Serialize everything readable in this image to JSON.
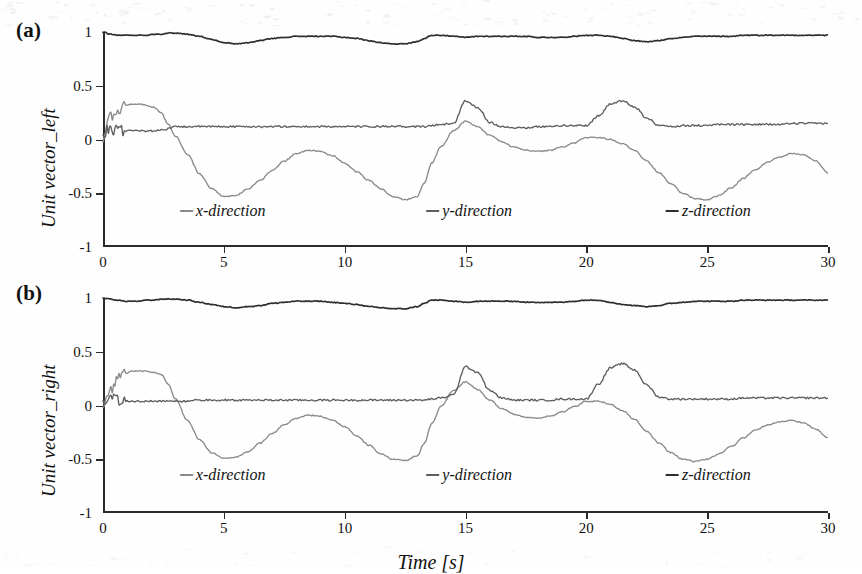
{
  "figure": {
    "xlabel": "Time [s]",
    "panels": [
      {
        "tag": "(a)",
        "ylabel": "Unit vector_left"
      },
      {
        "tag": "(b)",
        "ylabel": "Unit vector_right"
      }
    ]
  },
  "chart_data": [
    {
      "type": "line",
      "title": "(a) Unit vector_left",
      "xlabel": "Time [s]",
      "ylabel": "Unit vector_left",
      "xlim": [
        0,
        30
      ],
      "ylim": [
        -1,
        1
      ],
      "xticks": [
        0,
        5,
        10,
        15,
        20,
        25,
        30
      ],
      "xticklabels": [
        "0",
        "5",
        "10",
        "15",
        "20",
        "25",
        "30"
      ],
      "yticks": [
        -1,
        -0.5,
        0,
        0.5,
        1
      ],
      "yticklabels": [
        "-1",
        "-0.5",
        "0",
        "0.5",
        "1"
      ],
      "grid": false,
      "legend_position": "inside-bottom",
      "x": [
        0,
        0.3,
        0.6,
        0.9,
        1.2,
        1.5,
        1.8,
        2.1,
        2.4,
        2.7,
        3,
        3.5,
        4,
        4.5,
        5,
        5.5,
        6,
        6.5,
        7,
        7.5,
        8,
        8.5,
        9,
        9.5,
        10,
        10.5,
        11,
        11.5,
        12,
        12.5,
        13,
        13.3,
        13.6,
        14,
        14.5,
        15,
        15.5,
        16,
        16.5,
        17,
        17.5,
        18,
        18.5,
        19,
        19.5,
        20,
        20.5,
        21,
        21.5,
        22,
        22.5,
        23,
        23.5,
        24,
        24.5,
        25,
        25.5,
        26,
        26.5,
        27,
        27.5,
        28,
        28.5,
        29,
        29.5,
        30
      ],
      "series": [
        {
          "name": "x-direction",
          "color": "#8a8a8a",
          "values": [
            0.02,
            0.2,
            0.28,
            0.32,
            0.33,
            0.33,
            0.32,
            0.3,
            0.25,
            0.14,
            0.03,
            -0.14,
            -0.32,
            -0.46,
            -0.53,
            -0.52,
            -0.46,
            -0.38,
            -0.29,
            -0.2,
            -0.13,
            -0.1,
            -0.11,
            -0.15,
            -0.22,
            -0.3,
            -0.38,
            -0.46,
            -0.53,
            -0.56,
            -0.53,
            -0.4,
            -0.22,
            -0.06,
            0.08,
            0.17,
            0.12,
            0.04,
            -0.02,
            -0.07,
            -0.1,
            -0.11,
            -0.1,
            -0.07,
            -0.03,
            0.02,
            0.02,
            0.0,
            -0.04,
            -0.1,
            -0.2,
            -0.31,
            -0.41,
            -0.5,
            -0.55,
            -0.56,
            -0.52,
            -0.45,
            -0.36,
            -0.28,
            -0.21,
            -0.16,
            -0.13,
            -0.14,
            -0.2,
            -0.31
          ]
        },
        {
          "name": "y-direction",
          "color": "#5e5e5e",
          "values": [
            0.06,
            0.09,
            0.09,
            0.08,
            0.08,
            0.08,
            0.08,
            0.08,
            0.09,
            0.1,
            0.12,
            0.12,
            0.12,
            0.12,
            0.12,
            0.12,
            0.12,
            0.12,
            0.12,
            0.12,
            0.12,
            0.12,
            0.12,
            0.12,
            0.12,
            0.12,
            0.12,
            0.12,
            0.12,
            0.12,
            0.12,
            0.12,
            0.13,
            0.14,
            0.15,
            0.36,
            0.3,
            0.16,
            0.12,
            0.11,
            0.11,
            0.12,
            0.12,
            0.13,
            0.13,
            0.13,
            0.22,
            0.33,
            0.36,
            0.3,
            0.2,
            0.13,
            0.12,
            0.13,
            0.13,
            0.13,
            0.14,
            0.14,
            0.14,
            0.14,
            0.14,
            0.14,
            0.15,
            0.15,
            0.15,
            0.15
          ]
        },
        {
          "name": "z-direction",
          "color": "#2e2e2e",
          "values": [
            1.0,
            0.98,
            0.97,
            0.97,
            0.97,
            0.97,
            0.97,
            0.98,
            0.98,
            0.99,
            0.99,
            0.98,
            0.96,
            0.93,
            0.9,
            0.89,
            0.9,
            0.92,
            0.94,
            0.95,
            0.96,
            0.96,
            0.96,
            0.96,
            0.95,
            0.94,
            0.92,
            0.9,
            0.89,
            0.89,
            0.91,
            0.94,
            0.97,
            0.97,
            0.96,
            0.95,
            0.96,
            0.96,
            0.96,
            0.96,
            0.96,
            0.95,
            0.95,
            0.95,
            0.96,
            0.97,
            0.97,
            0.96,
            0.94,
            0.92,
            0.91,
            0.92,
            0.94,
            0.95,
            0.96,
            0.96,
            0.96,
            0.96,
            0.97,
            0.97,
            0.97,
            0.97,
            0.97,
            0.97,
            0.97,
            0.97
          ]
        }
      ]
    },
    {
      "type": "line",
      "title": "(b) Unit vector_right",
      "xlabel": "Time [s]",
      "ylabel": "Unit vector_right",
      "xlim": [
        0,
        30
      ],
      "ylim": [
        -1,
        1
      ],
      "xticks": [
        0,
        5,
        10,
        15,
        20,
        25,
        30
      ],
      "xticklabels": [
        "0",
        "5",
        "10",
        "15",
        "20",
        "25",
        "30"
      ],
      "yticks": [
        -1,
        -0.5,
        0,
        0.5,
        1
      ],
      "yticklabels": [
        "-1",
        "-0.5",
        "0",
        "0.5",
        "1"
      ],
      "grid": false,
      "legend_position": "inside-bottom",
      "x": [
        0,
        0.3,
        0.6,
        0.9,
        1.2,
        1.5,
        1.8,
        2.1,
        2.4,
        2.7,
        3,
        3.5,
        4,
        4.5,
        5,
        5.5,
        6,
        6.5,
        7,
        7.5,
        8,
        8.5,
        9,
        9.5,
        10,
        10.5,
        11,
        11.5,
        12,
        12.5,
        13,
        13.3,
        13.6,
        14,
        14.5,
        15,
        15.5,
        16,
        16.5,
        17,
        17.5,
        18,
        18.5,
        19,
        19.5,
        20,
        20.5,
        21,
        21.5,
        22,
        22.5,
        23,
        23.5,
        24,
        24.5,
        25,
        25.5,
        26,
        26.5,
        27,
        27.5,
        28,
        28.5,
        29,
        29.5,
        30
      ],
      "series": [
        {
          "name": "x-direction",
          "color": "#8a8a8a",
          "values": [
            0.0,
            0.15,
            0.24,
            0.3,
            0.32,
            0.32,
            0.32,
            0.31,
            0.29,
            0.2,
            0.06,
            -0.14,
            -0.32,
            -0.44,
            -0.49,
            -0.48,
            -0.43,
            -0.35,
            -0.26,
            -0.18,
            -0.12,
            -0.09,
            -0.1,
            -0.14,
            -0.2,
            -0.28,
            -0.37,
            -0.45,
            -0.5,
            -0.51,
            -0.47,
            -0.35,
            -0.17,
            0.0,
            0.14,
            0.22,
            0.15,
            0.05,
            -0.03,
            -0.08,
            -0.11,
            -0.12,
            -0.1,
            -0.06,
            -0.01,
            0.04,
            0.04,
            0.01,
            -0.05,
            -0.13,
            -0.24,
            -0.35,
            -0.44,
            -0.5,
            -0.52,
            -0.5,
            -0.45,
            -0.38,
            -0.3,
            -0.23,
            -0.18,
            -0.15,
            -0.14,
            -0.16,
            -0.22,
            -0.3
          ]
        },
        {
          "name": "y-direction",
          "color": "#5e5e5e",
          "values": [
            0.02,
            0.06,
            0.05,
            0.04,
            0.04,
            0.04,
            0.04,
            0.04,
            0.04,
            0.04,
            0.04,
            0.04,
            0.05,
            0.05,
            0.05,
            0.05,
            0.05,
            0.05,
            0.05,
            0.05,
            0.05,
            0.05,
            0.05,
            0.05,
            0.05,
            0.05,
            0.05,
            0.05,
            0.05,
            0.05,
            0.05,
            0.05,
            0.06,
            0.07,
            0.1,
            0.36,
            0.31,
            0.14,
            0.07,
            0.05,
            0.05,
            0.05,
            0.05,
            0.06,
            0.06,
            0.06,
            0.2,
            0.35,
            0.39,
            0.33,
            0.19,
            0.08,
            0.06,
            0.06,
            0.06,
            0.06,
            0.06,
            0.06,
            0.07,
            0.07,
            0.07,
            0.07,
            0.07,
            0.07,
            0.07,
            0.07
          ]
        },
        {
          "name": "z-direction",
          "color": "#2e2e2e",
          "values": [
            1.0,
            0.99,
            0.98,
            0.97,
            0.97,
            0.97,
            0.98,
            0.98,
            0.99,
            0.99,
            0.99,
            0.98,
            0.96,
            0.94,
            0.92,
            0.91,
            0.92,
            0.93,
            0.95,
            0.96,
            0.97,
            0.97,
            0.97,
            0.96,
            0.95,
            0.94,
            0.92,
            0.91,
            0.9,
            0.9,
            0.92,
            0.95,
            0.98,
            0.98,
            0.97,
            0.96,
            0.97,
            0.97,
            0.97,
            0.97,
            0.96,
            0.96,
            0.96,
            0.96,
            0.97,
            0.98,
            0.98,
            0.96,
            0.94,
            0.93,
            0.92,
            0.93,
            0.95,
            0.96,
            0.97,
            0.97,
            0.97,
            0.97,
            0.98,
            0.98,
            0.98,
            0.98,
            0.98,
            0.98,
            0.98,
            0.98
          ]
        }
      ]
    }
  ],
  "legend": {
    "items": [
      {
        "label": "x-direction",
        "color": "#8a8a8a",
        "cx_fraction": 0.165
      },
      {
        "label": "y-direction",
        "color": "#5e5e5e",
        "cx_fraction": 0.505
      },
      {
        "label": "z-direction",
        "color": "#2e2e2e",
        "cx_fraction": 0.835
      }
    ]
  }
}
